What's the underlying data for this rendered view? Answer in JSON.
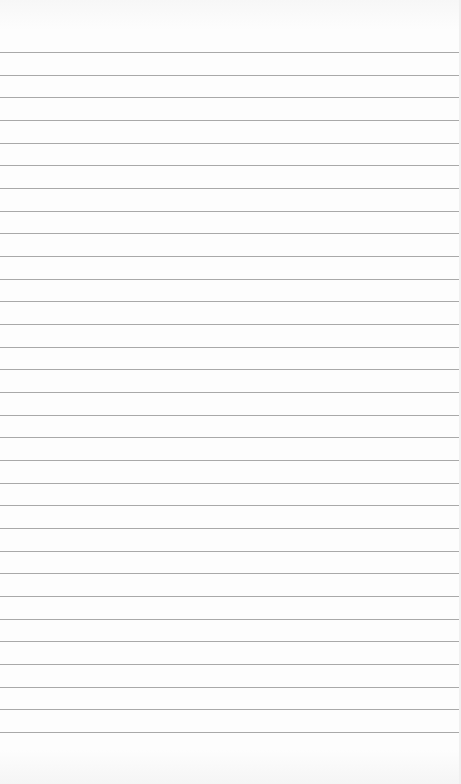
{
  "paper": {
    "type": "lined-notepad-page",
    "line_count": 31,
    "first_line_y": 52,
    "line_spacing": 22.67,
    "line_color": "#a9a9a9",
    "background_color": "#fdfdfd"
  }
}
